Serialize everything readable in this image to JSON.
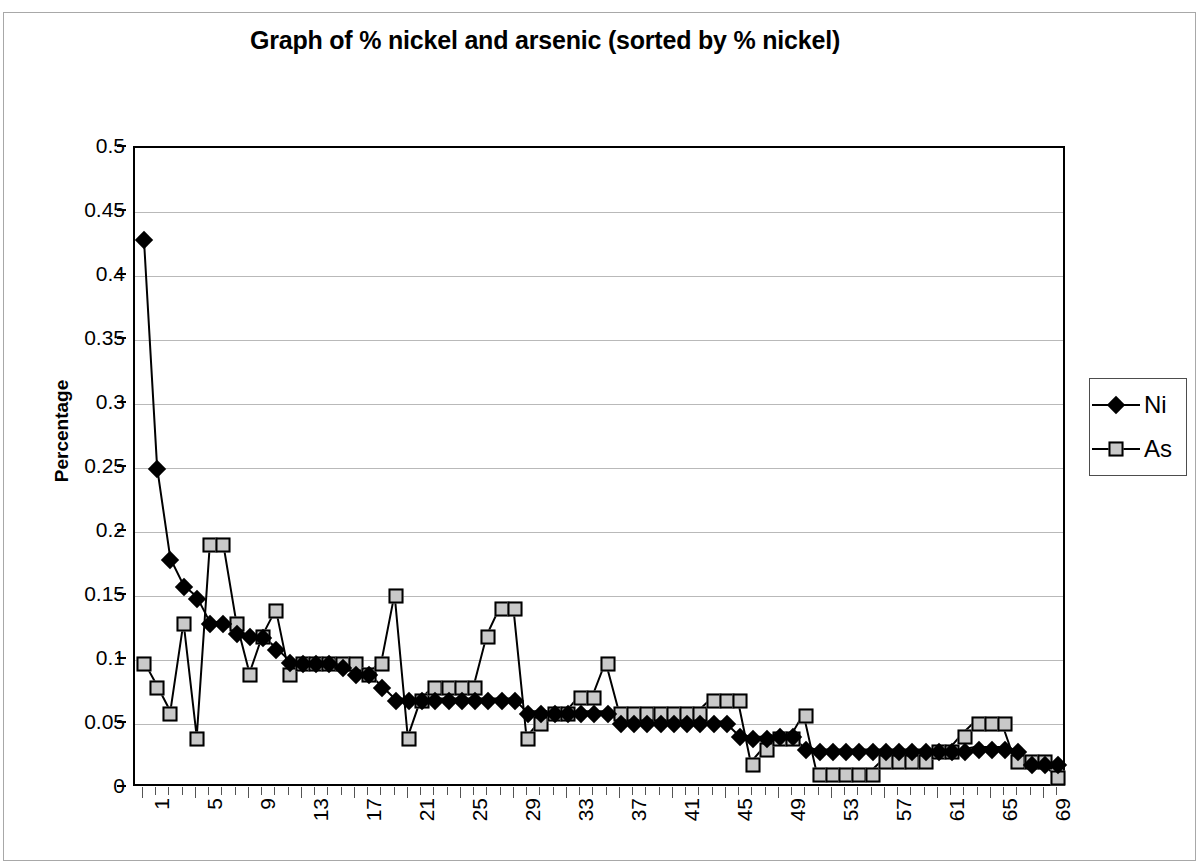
{
  "chart_data": {
    "type": "line",
    "title": "Graph of % nickel and arsenic (sorted by % nickel)",
    "xlabel": "",
    "ylabel": "Percentage",
    "ylim": [
      0,
      0.5
    ],
    "xlim": [
      1,
      70
    ],
    "ytick_labels": [
      "0.5",
      "0.45",
      "0.4",
      "0.35",
      "0.3",
      "0.25",
      "0.2",
      "0.15",
      "0.1",
      "0.05",
      "0"
    ],
    "ytick_values": [
      0.5,
      0.45,
      0.4,
      0.35,
      0.3,
      0.25,
      0.2,
      0.15,
      0.1,
      0.05,
      0
    ],
    "xtick_labels": [
      "1",
      "5",
      "9",
      "13",
      "17",
      "21",
      "25",
      "29",
      "33",
      "37",
      "41",
      "45",
      "49",
      "53",
      "57",
      "61",
      "65",
      "69"
    ],
    "xtick_values": [
      1,
      5,
      9,
      13,
      17,
      21,
      25,
      29,
      33,
      37,
      41,
      45,
      49,
      53,
      57,
      61,
      65,
      69
    ],
    "grid": true,
    "legend_position": "right",
    "x": [
      1,
      2,
      3,
      4,
      5,
      6,
      7,
      8,
      9,
      10,
      11,
      12,
      13,
      14,
      15,
      16,
      17,
      18,
      19,
      20,
      21,
      22,
      23,
      24,
      25,
      26,
      27,
      28,
      29,
      30,
      31,
      32,
      33,
      34,
      35,
      36,
      37,
      38,
      39,
      40,
      41,
      42,
      43,
      44,
      45,
      46,
      47,
      48,
      49,
      50,
      51,
      52,
      53,
      54,
      55,
      56,
      57,
      58,
      59,
      60,
      61,
      62,
      63,
      64,
      65,
      66,
      67,
      68,
      69,
      70
    ],
    "series": [
      {
        "name": "Ni",
        "marker": "diamond",
        "color": "#000000",
        "values": [
          0.428,
          0.249,
          0.178,
          0.157,
          0.148,
          0.128,
          0.128,
          0.12,
          0.118,
          0.117,
          0.108,
          0.098,
          0.097,
          0.097,
          0.097,
          0.094,
          0.088,
          0.088,
          0.078,
          0.068,
          0.068,
          0.068,
          0.068,
          0.068,
          0.068,
          0.068,
          0.068,
          0.068,
          0.068,
          0.058,
          0.058,
          0.058,
          0.058,
          0.058,
          0.058,
          0.058,
          0.05,
          0.05,
          0.05,
          0.05,
          0.05,
          0.05,
          0.05,
          0.05,
          0.05,
          0.04,
          0.038,
          0.038,
          0.04,
          0.04,
          0.03,
          0.028,
          0.028,
          0.028,
          0.028,
          0.028,
          0.028,
          0.028,
          0.028,
          0.028,
          0.028,
          0.028,
          0.028,
          0.03,
          0.03,
          0.03,
          0.028,
          0.018,
          0.018,
          0.018
        ]
      },
      {
        "name": "As",
        "marker": "square",
        "color": "#c9c9c9",
        "values": [
          0.097,
          0.078,
          0.058,
          0.128,
          0.038,
          0.19,
          0.19,
          0.128,
          0.088,
          0.118,
          0.138,
          0.088,
          0.097,
          0.097,
          0.097,
          0.097,
          0.097,
          0.088,
          0.097,
          0.15,
          0.038,
          0.068,
          0.078,
          0.078,
          0.078,
          0.078,
          0.118,
          0.14,
          0.14,
          0.038,
          0.05,
          0.058,
          0.058,
          0.07,
          0.07,
          0.097,
          0.058,
          0.058,
          0.058,
          0.058,
          0.058,
          0.058,
          0.058,
          0.068,
          0.068,
          0.068,
          0.018,
          0.03,
          0.038,
          0.038,
          0.056,
          0.01,
          0.01,
          0.01,
          0.01,
          0.01,
          0.02,
          0.02,
          0.02,
          0.02,
          0.028,
          0.028,
          0.04,
          0.05,
          0.05,
          0.05,
          0.02,
          0.02,
          0.02,
          0.008
        ]
      }
    ]
  },
  "legend": {
    "items": [
      {
        "label": "Ni",
        "marker": "diamond"
      },
      {
        "label": "As",
        "marker": "square"
      }
    ]
  }
}
